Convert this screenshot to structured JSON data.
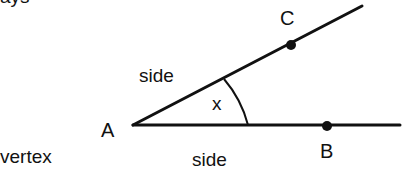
{
  "diagram": {
    "type": "angle",
    "partial_top_text": "ays",
    "labels": {
      "vertex_point": "A",
      "ray_point_upper": "C",
      "ray_point_lower": "B",
      "angle": "x",
      "side_upper": "side",
      "side_lower": "side",
      "vertex_caption": "vertex"
    },
    "geometry": {
      "vertex": [
        133,
        125
      ],
      "ray_upper_end": [
        362,
        6
      ],
      "ray_lower_end": [
        400,
        125
      ],
      "point_C": [
        291,
        45
      ],
      "point_B": [
        327,
        126
      ],
      "arc_radius": 115
    },
    "colors": {
      "stroke": "#111111",
      "background": "#ffffff"
    }
  }
}
